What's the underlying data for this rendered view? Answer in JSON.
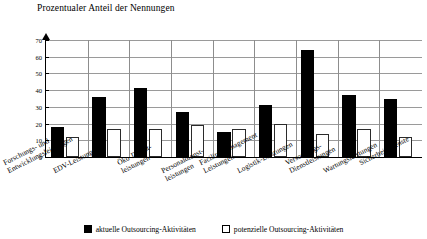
{
  "chart_data": {
    "type": "bar",
    "title": "Prozentualer Anteil der Nennungen",
    "ylabel": "Prozentualer Anteil der Nennungen",
    "xlabel": "",
    "ylim": [
      0,
      70
    ],
    "yticks": [
      0,
      10,
      20,
      30,
      40,
      50,
      60,
      70
    ],
    "grid": true,
    "legend_position": "bottom",
    "categories": [
      "Forschungs- und\nEntwicklungsleistungen",
      "EDV-Leistungen",
      "Öko-Dienst-\nleistungen",
      "Personaldienst-\nleistungen",
      "Facility Management\nLeistungen",
      "Logistik-Leistungen",
      "Versorgungs-\nDienstleistungen",
      "Wartungsleistungen",
      "Sicherheitsdienste"
    ],
    "series": [
      {
        "name": "aktuelle Outsourcing-Aktivitäten",
        "color": "#000000",
        "values": [
          18,
          36,
          41,
          27,
          15,
          31,
          64,
          37,
          35
        ]
      },
      {
        "name": "potenzielle Outsourcing-Aktivitäten",
        "color": "#ffffff",
        "values": [
          12,
          17,
          17,
          19,
          17,
          20,
          14,
          17,
          12
        ]
      }
    ]
  },
  "legend": {
    "items": [
      {
        "label": "aktuelle Outsourcing-Aktivitäten",
        "swatch": "filled-black-square"
      },
      {
        "label": "potenzielle Outsourcing-Aktivitäten",
        "swatch": "outlined-white-square"
      }
    ]
  }
}
